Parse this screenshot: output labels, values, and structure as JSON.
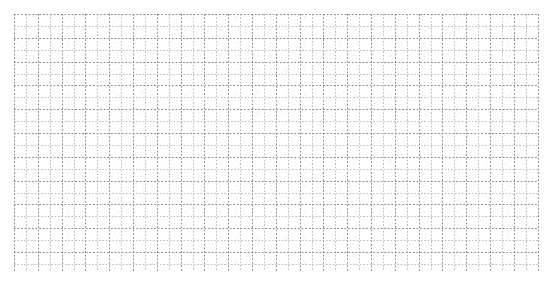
{
  "document": {
    "kind": "scanned-grid-sheet",
    "page_width": 558,
    "page_height": 286,
    "background_color": "#ffffff",
    "header": {
      "text": "—— —— — ——— ——  — — —— — —",
      "legible": "no",
      "note_color": "#b9bdc4"
    },
    "grid": {
      "left": 14,
      "top": 14,
      "width": 524,
      "height": 257,
      "minor_cell_px": 11.9,
      "major_every": 2,
      "columns": 44,
      "rows": 21,
      "minor_line_color": "#a9b2bd",
      "major_line_color": "#7d8a98",
      "line_style": "dotted",
      "fill_color": "#ffffff"
    }
  }
}
